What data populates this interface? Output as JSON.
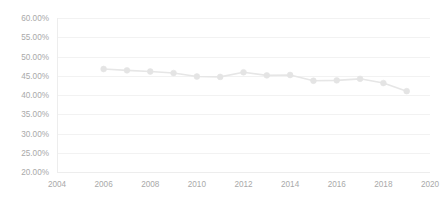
{
  "chart_data": {
    "type": "line",
    "title": "",
    "subtitle": "",
    "xlabel": "",
    "ylabel": "",
    "xlim": [
      2004,
      2020
    ],
    "ylim": [
      0.2,
      0.6
    ],
    "grid": true,
    "legend": false,
    "legend_position": "none",
    "y_tick_labels": [
      "60.00%",
      "55.00%",
      "50.00%",
      "45.00%",
      "40.00%",
      "35.00%",
      "30.00%",
      "25.00%",
      "20.00%"
    ],
    "y_tick_values": [
      0.6,
      0.55,
      0.5,
      0.45,
      0.4,
      0.35,
      0.3,
      0.25,
      0.2
    ],
    "x_tick_labels": [
      "2004",
      "2006",
      "2008",
      "2010",
      "2012",
      "2014",
      "2016",
      "2018",
      "2020"
    ],
    "x_tick_values": [
      2004,
      2006,
      2008,
      2010,
      2012,
      2014,
      2016,
      2018,
      2020
    ],
    "x": [
      2006,
      2007,
      2008,
      2009,
      2010,
      2011,
      2012,
      2013,
      2014,
      2015,
      2016,
      2017,
      2018,
      2019
    ],
    "values": [
      0.4675,
      0.464,
      0.461,
      0.457,
      0.448,
      0.447,
      0.459,
      0.451,
      0.452,
      0.437,
      0.438,
      0.442,
      0.431,
      0.41
    ],
    "series": [
      {
        "name": "series-1",
        "color": "#e4e4e4",
        "x": [
          2006,
          2007,
          2008,
          2009,
          2010,
          2011,
          2012,
          2013,
          2014,
          2015,
          2016,
          2017,
          2018,
          2019
        ],
        "values": [
          0.4675,
          0.464,
          0.461,
          0.457,
          0.448,
          0.447,
          0.459,
          0.451,
          0.452,
          0.437,
          0.438,
          0.442,
          0.431,
          0.41
        ]
      }
    ]
  },
  "style": {
    "background": "#ffffff",
    "grid_color": "#f2f2f2",
    "axis_color": "#ededed",
    "tick_text_color": "#a9a9a9",
    "series_color": "#e4e4e4"
  },
  "plot_area": {
    "left": 57,
    "right": 430,
    "top": 18,
    "bottom": 172
  }
}
